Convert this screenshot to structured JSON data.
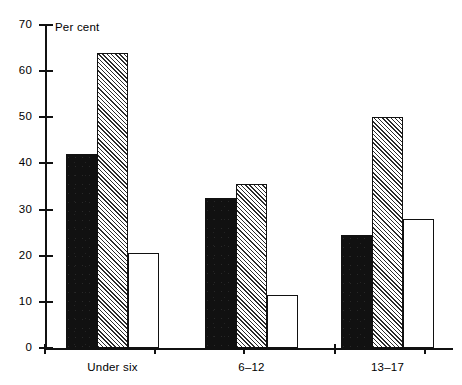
{
  "chart_data": {
    "type": "bar",
    "title": "",
    "subtitle": "",
    "xlabel": "",
    "ylabel": "Per cent",
    "ylim": [
      0,
      70
    ],
    "ytick_labels": [
      "0",
      "10",
      "20",
      "30",
      "40",
      "50",
      "60",
      "70"
    ],
    "ytick_values": [
      0,
      10,
      20,
      30,
      40,
      50,
      60,
      70
    ],
    "grid": false,
    "legend": "none",
    "categories": [
      "Under six",
      "6–12",
      "13–17"
    ],
    "series": [
      {
        "name": "series-1",
        "style": "solid-black",
        "values": [
          42,
          32.5,
          24.5
        ]
      },
      {
        "name": "series-2",
        "style": "diagonal-hatch",
        "values": [
          64,
          35.5,
          50
        ]
      },
      {
        "name": "series-3",
        "style": "open-white",
        "values": [
          20.5,
          11.5,
          28
        ]
      }
    ]
  },
  "axis": {
    "y_title": "Per cent"
  },
  "colors": {
    "axis": "#111111",
    "solid_bar": "#111111",
    "hatch_line": "#2b2b2b",
    "open_bar": "#ffffff",
    "background": "#ffffff"
  }
}
